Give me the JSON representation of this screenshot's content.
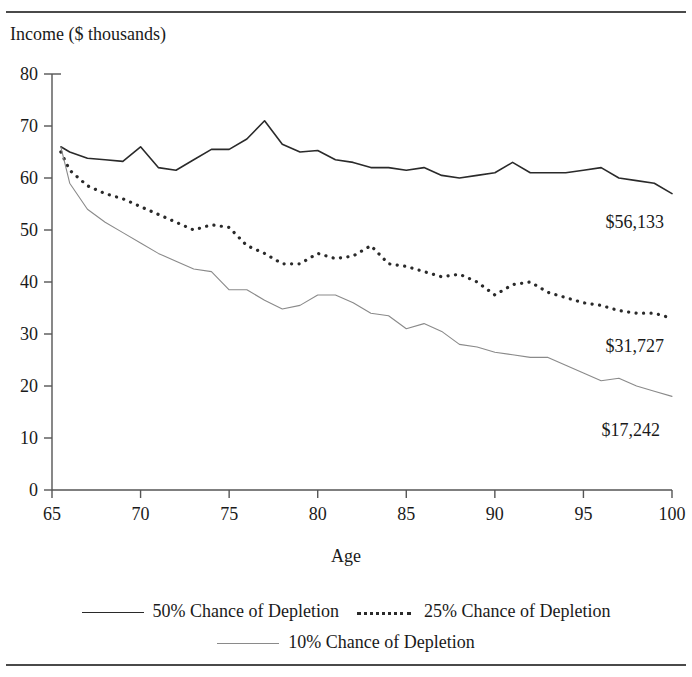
{
  "figure": {
    "title": "",
    "axis_label_y": "Income ($ thousands)",
    "axis_label_x": "Age"
  },
  "legend": {
    "entries": [
      {
        "label": "50% Chance of Depletion",
        "style": "solid",
        "color": "#2a2a2a"
      },
      {
        "label": "25% Chance of Depletion",
        "style": "dotted",
        "color": "#2a2a2a"
      },
      {
        "label": "10% Chance of Depletion",
        "style": "thin-solid",
        "color": "#8a8a8a"
      }
    ]
  },
  "annotations": [
    {
      "text": "$56,133",
      "series": "50% Chance of Depletion"
    },
    {
      "text": "$31,727",
      "series": "25% Chance of Depletion"
    },
    {
      "text": "$17,242",
      "series": "10% Chance of Depletion"
    }
  ],
  "chart_data": {
    "type": "line",
    "title": "",
    "xlabel": "Age",
    "ylabel": "Income ($ thousands)",
    "xlim": [
      65,
      100
    ],
    "ylim": [
      0,
      80
    ],
    "xticks": [
      65,
      70,
      75,
      80,
      85,
      90,
      95,
      100
    ],
    "yticks": [
      0,
      10,
      20,
      30,
      40,
      50,
      60,
      70,
      80
    ],
    "grid": false,
    "legend_position": "below",
    "x": [
      65.5,
      66,
      67,
      68,
      69,
      70,
      71,
      72,
      73,
      74,
      75,
      76,
      77,
      78,
      79,
      80,
      81,
      82,
      83,
      84,
      85,
      86,
      87,
      88,
      89,
      90,
      91,
      92,
      93,
      94,
      95,
      96,
      97,
      98,
      99,
      100
    ],
    "series": [
      {
        "name": "50% Chance of Depletion",
        "style": "solid",
        "color": "#2a2a2a",
        "end_value_label": "$56,133",
        "values": [
          66.0,
          65.0,
          63.8,
          63.5,
          63.2,
          66.0,
          62.0,
          61.5,
          63.5,
          65.5,
          65.5,
          67.5,
          71.0,
          66.5,
          65.0,
          65.3,
          63.5,
          63.0,
          62.0,
          62.0,
          61.5,
          62.0,
          60.5,
          60.0,
          60.5,
          61.0,
          63.0,
          61.0,
          61.0,
          61.0,
          61.5,
          62.0,
          60.0,
          59.5,
          59.0,
          57.0
        ]
      },
      {
        "name": "25% Chance of Depletion",
        "style": "dotted",
        "color": "#2a2a2a",
        "end_value_label": "$31,727",
        "values": [
          65.0,
          61.5,
          58.5,
          57.0,
          56.0,
          54.5,
          53.0,
          51.5,
          50.0,
          51.0,
          50.5,
          47.0,
          45.5,
          43.5,
          43.5,
          45.5,
          44.5,
          45.0,
          47.0,
          43.5,
          43.0,
          42.0,
          41.0,
          41.5,
          40.0,
          37.5,
          39.5,
          40.0,
          38.0,
          37.0,
          36.0,
          35.5,
          34.5,
          34.0,
          34.0,
          33.0
        ]
      },
      {
        "name": "10% Chance of Depletion",
        "style": "thin-solid",
        "color": "#8a8a8a",
        "end_value_label": "$17,242",
        "values": [
          66.0,
          59.0,
          54.0,
          51.5,
          49.5,
          47.5,
          45.5,
          44.0,
          42.5,
          42.0,
          38.5,
          38.5,
          36.5,
          34.8,
          35.5,
          37.5,
          37.5,
          36.0,
          34.0,
          33.5,
          31.0,
          32.0,
          30.5,
          28.0,
          27.5,
          26.5,
          26.0,
          25.5,
          25.5,
          24.0,
          22.5,
          21.0,
          21.5,
          20.0,
          19.0,
          18.0
        ]
      }
    ]
  }
}
